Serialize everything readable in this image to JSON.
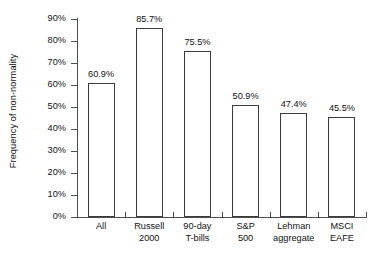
{
  "chart_data": {
    "type": "bar",
    "title": "",
    "xlabel": "",
    "ylabel": "Frequency of non-normality",
    "ylim": [
      0,
      90
    ],
    "grid": false,
    "legend": "none",
    "ytick_labels": [
      "0%",
      "10%",
      "20%",
      "30%",
      "40%",
      "50%",
      "60%",
      "70%",
      "80%",
      "90%"
    ],
    "ytick_values": [
      0,
      10,
      20,
      30,
      40,
      50,
      60,
      70,
      80,
      90
    ],
    "categories": [
      "All",
      "Russell 2000",
      "90-day T-bills",
      "S&P 500",
      "Lehman aggregate",
      "MSCI EAFE"
    ],
    "category_lines": [
      [
        "All",
        ""
      ],
      [
        "Russell",
        "2000"
      ],
      [
        "90-day",
        "T-bills"
      ],
      [
        "S&P",
        "500"
      ],
      [
        "Lehman",
        "aggregate"
      ],
      [
        "MSCI",
        "EAFE"
      ]
    ],
    "values": [
      60.9,
      85.7,
      75.5,
      50.9,
      47.4,
      45.5
    ],
    "value_labels": [
      "60.9%",
      "85.7%",
      "75.5%",
      "50.9%",
      "47.4%",
      "45.5%"
    ],
    "colors": {
      "bar_fill": "#ffffff",
      "bar_edge": "#3c3c3c",
      "axis": "#4d4d4d",
      "text": "#111111",
      "background": "#ffffff"
    }
  }
}
